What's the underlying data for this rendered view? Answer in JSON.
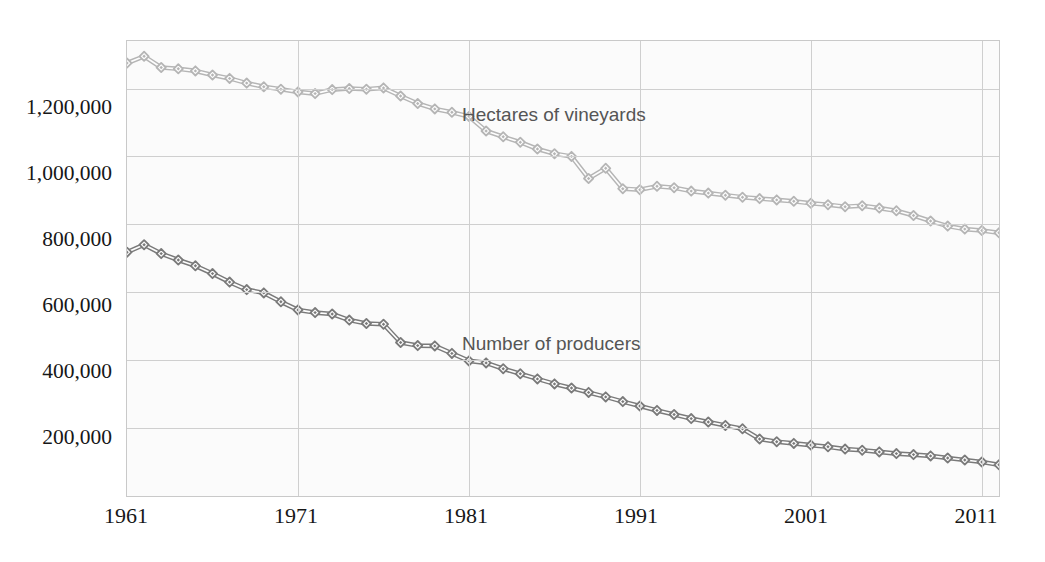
{
  "chart_data": {
    "type": "line",
    "title": "",
    "subtitle": "",
    "xlabel": "",
    "ylabel": "",
    "xlim": [
      1961,
      2012
    ],
    "ylim": [
      0,
      1340000
    ],
    "grid": true,
    "legend_position": "inline-annotation",
    "y_ticks": [
      "200,000",
      "400,000",
      "600,000",
      "800,000",
      "1,000,000",
      "1,200,000"
    ],
    "y_tick_values": [
      200000,
      400000,
      600000,
      800000,
      1000000,
      1200000
    ],
    "x_ticks": [
      "1961",
      "1971",
      "1981",
      "1991",
      "2001",
      "2011"
    ],
    "x_tick_values": [
      1961,
      1971,
      1981,
      1991,
      2001,
      2011
    ],
    "x": [
      1961,
      1962,
      1963,
      1964,
      1965,
      1966,
      1967,
      1968,
      1969,
      1970,
      1971,
      1972,
      1973,
      1974,
      1975,
      1976,
      1977,
      1978,
      1979,
      1980,
      1981,
      1982,
      1983,
      1984,
      1985,
      1986,
      1987,
      1988,
      1989,
      1990,
      1991,
      1992,
      1993,
      1994,
      1995,
      1996,
      1997,
      1998,
      1999,
      2000,
      2001,
      2002,
      2003,
      2004,
      2005,
      2006,
      2007,
      2008,
      2009,
      2010,
      2011,
      2012
    ],
    "series": [
      {
        "name": "Hectares of vineyards",
        "color": "#b5b5b5",
        "marker": "diamond",
        "values": [
          1275000,
          1295000,
          1262000,
          1258000,
          1252000,
          1240000,
          1230000,
          1216000,
          1205000,
          1198000,
          1190000,
          1185000,
          1197000,
          1200000,
          1198000,
          1202000,
          1178000,
          1156000,
          1140000,
          1130000,
          1118000,
          1075000,
          1058000,
          1042000,
          1022000,
          1008000,
          1000000,
          935000,
          965000,
          905000,
          902000,
          912000,
          908000,
          898000,
          892000,
          886000,
          880000,
          876000,
          872000,
          868000,
          862000,
          858000,
          852000,
          855000,
          848000,
          840000,
          826000,
          810000,
          795000,
          786000,
          782000,
          775000
        ]
      },
      {
        "name": "Number of producers",
        "color": "#7a7a7a",
        "marker": "diamond",
        "values": [
          718000,
          740000,
          714000,
          695000,
          678000,
          655000,
          630000,
          608000,
          598000,
          572000,
          548000,
          540000,
          536000,
          518000,
          508000,
          506000,
          452000,
          443000,
          442000,
          420000,
          398000,
          392000,
          375000,
          360000,
          345000,
          330000,
          318000,
          305000,
          292000,
          278000,
          265000,
          252000,
          240000,
          228000,
          218000,
          208000,
          198000,
          168000,
          160000,
          155000,
          150000,
          145000,
          138000,
          135000,
          130000,
          125000,
          122000,
          118000,
          112000,
          106000,
          100000,
          92000
        ]
      }
    ],
    "annotations": [
      {
        "text": "Hectares of vineyards",
        "color": "#555555"
      },
      {
        "text": "Number of producers",
        "color": "#555555"
      }
    ]
  },
  "axis": {
    "y_tick_labels": [
      "1,200,000",
      "1,000,000",
      "800,000",
      "600,000",
      "400,000",
      "200,000"
    ],
    "x_tick_labels": [
      "1961",
      "1971",
      "1981",
      "1991",
      "2001",
      "2011"
    ]
  },
  "labels": {
    "hectares": "Hectares of vineyards",
    "producers": "Number of producers"
  },
  "colors": {
    "series_upper": "#b5b5b5",
    "series_lower": "#7a7a7a",
    "grid": "#cfcfcf",
    "plot_border": "#c9c9c9",
    "plot_background": "#fbfbfb",
    "text": "#171717",
    "annotation_text": "#555555"
  }
}
